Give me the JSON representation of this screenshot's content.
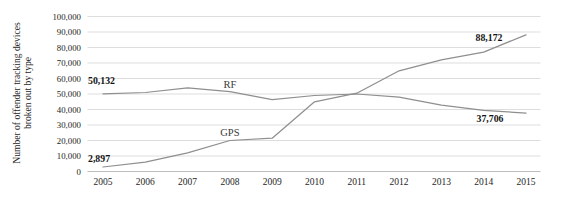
{
  "chart_data": {
    "type": "line",
    "title": "",
    "ylabel": "Number of offender tracking devices broken out by type",
    "ylabel_lines": [
      "Number of offender tracking devices",
      "broken out by type"
    ],
    "xlabel": "",
    "categories": [
      "2005",
      "2006",
      "2007",
      "2008",
      "2009",
      "2010",
      "2011",
      "2012",
      "2013",
      "2014",
      "2015"
    ],
    "series": [
      {
        "name": "RF",
        "values": [
          50132,
          51000,
          54000,
          51500,
          46300,
          49000,
          50000,
          48000,
          42800,
          39500,
          37706
        ]
      },
      {
        "name": "GPS",
        "values": [
          2897,
          6000,
          12000,
          20000,
          21500,
          45000,
          50500,
          65000,
          72000,
          77000,
          88172
        ]
      }
    ],
    "ylim": [
      0,
      100000
    ],
    "grid": true,
    "legend_position": "inline-labels",
    "colors": {
      "line": "#8f8f8f",
      "gridline": "#d9d9d9",
      "axis_line": "#bdbdbd",
      "tick_text": "#262626",
      "background": "#ffffff"
    },
    "yticks": [
      {
        "value": 0,
        "label": "0"
      },
      {
        "value": 10000,
        "label": "10,000"
      },
      {
        "value": 20000,
        "label": "20,000"
      },
      {
        "value": 30000,
        "label": "30,000"
      },
      {
        "value": 40000,
        "label": "40,000"
      },
      {
        "value": 50000,
        "label": "50,000"
      },
      {
        "value": 60000,
        "label": "60,000"
      },
      {
        "value": 70000,
        "label": "70,000"
      },
      {
        "value": 80000,
        "label": "80,000"
      },
      {
        "value": 90000,
        "label": "90,000"
      },
      {
        "value": 100000,
        "label": "100,000"
      }
    ],
    "annotations": [
      {
        "text": "50,132",
        "series": 0,
        "index": 0,
        "anchor": "start",
        "dx": -15,
        "dy": -10
      },
      {
        "text": "2,897",
        "series": 1,
        "index": 0,
        "anchor": "start",
        "dx": -15,
        "dy": -5
      },
      {
        "text": "88,172",
        "series": 1,
        "index": 10,
        "anchor": "middle",
        "dx": -37,
        "dy": 6
      },
      {
        "text": "37,706",
        "series": 0,
        "index": 10,
        "anchor": "middle",
        "dx": -36,
        "dy": 9
      }
    ],
    "series_labels": [
      {
        "text": "RF",
        "series": 0,
        "index": 3,
        "dy": -3.5
      },
      {
        "text": "GPS",
        "series": 1,
        "index": 3,
        "dy": -4.5
      }
    ]
  }
}
